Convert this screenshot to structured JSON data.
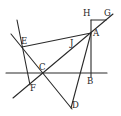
{
  "figure": {
    "type": "geometric-construction",
    "points": {
      "A": {
        "label": "A",
        "x": 91,
        "y": 33
      },
      "B": {
        "label": "B",
        "x": 91,
        "y": 73
      },
      "C": {
        "label": "C",
        "x": 44,
        "y": 73
      },
      "D": {
        "label": "D",
        "x": 71,
        "y": 108
      },
      "E": {
        "label": "E",
        "x": 22,
        "y": 47
      },
      "F": {
        "label": "F",
        "x": 29,
        "y": 83
      },
      "G": {
        "label": "G",
        "x": 107,
        "y": 20
      },
      "H": {
        "label": "H",
        "x": 91,
        "y": 20
      },
      "J": {
        "label": "J",
        "x": 70,
        "y": 43
      }
    },
    "labels": [
      {
        "id": "A",
        "text": "A"
      },
      {
        "id": "B",
        "text": "B"
      },
      {
        "id": "C",
        "text": "C"
      },
      {
        "id": "D",
        "text": "D"
      },
      {
        "id": "E",
        "text": "E"
      },
      {
        "id": "F",
        "text": "F"
      },
      {
        "id": "G",
        "text": "G"
      },
      {
        "id": "H",
        "text": "H"
      },
      {
        "id": "J",
        "text": "J"
      }
    ],
    "segments": [
      "horizontal line through C and B",
      "line G-A-J-C-F extended",
      "line through E and F",
      "line through E, C to D",
      "E-A",
      "A-D",
      "H-B vertical",
      "H-G horizontal"
    ],
    "line_color": "#2a2a2a"
  }
}
